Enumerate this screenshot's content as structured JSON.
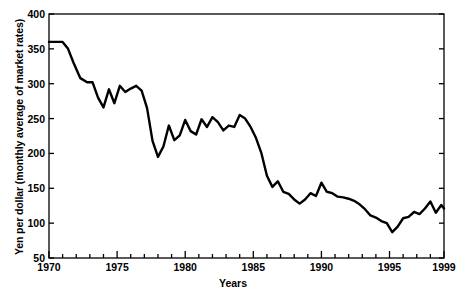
{
  "chart_data": {
    "type": "line",
    "title": "",
    "xlabel": "Years",
    "ylabel": "Yen per dollar (monthly average of market rates)",
    "xlim": [
      1970,
      1999
    ],
    "ylim": [
      50,
      400
    ],
    "grid": false,
    "legend": null,
    "y_ticks": [
      50,
      100,
      150,
      200,
      250,
      300,
      350,
      400
    ],
    "y_tick_labels": [
      "50",
      "100",
      "150",
      "200",
      "250",
      "300",
      "350",
      "400"
    ],
    "x_ticks": [
      1970,
      1975,
      1980,
      1985,
      1990,
      1995,
      1999
    ],
    "x_tick_labels": [
      "1970",
      "1975",
      "1980",
      "1985",
      "1990",
      "1995",
      "1999"
    ],
    "x_minor_tick_interval": 1,
    "line_color": "#000000",
    "line_width": 2.4,
    "series": [
      {
        "name": "Yen per dollar",
        "x": [
          1970.0,
          1970.5,
          1971.0,
          1971.4,
          1971.8,
          1972.3,
          1972.8,
          1973.2,
          1973.6,
          1974.0,
          1974.4,
          1974.8,
          1975.2,
          1975.6,
          1976.0,
          1976.4,
          1976.8,
          1977.2,
          1977.6,
          1978.0,
          1978.4,
          1978.8,
          1979.2,
          1979.6,
          1980.0,
          1980.4,
          1980.8,
          1981.2,
          1981.6,
          1982.0,
          1982.4,
          1982.8,
          1983.2,
          1983.6,
          1984.0,
          1984.4,
          1984.8,
          1985.2,
          1985.6,
          1986.0,
          1986.4,
          1986.8,
          1987.2,
          1987.6,
          1988.0,
          1988.4,
          1988.8,
          1989.2,
          1989.6,
          1990.0,
          1990.4,
          1990.8,
          1991.2,
          1991.6,
          1992.0,
          1992.4,
          1992.8,
          1993.2,
          1993.6,
          1994.0,
          1994.4,
          1994.8,
          1995.2,
          1995.6,
          1996.0,
          1996.4,
          1996.8,
          1997.2,
          1997.6,
          1998.0,
          1998.4,
          1998.8,
          1999.0
        ],
        "values": [
          360,
          360,
          360,
          350,
          330,
          308,
          302,
          302,
          280,
          266,
          292,
          272,
          297,
          288,
          293,
          297,
          290,
          265,
          218,
          195,
          210,
          240,
          219,
          226,
          248,
          232,
          227,
          249,
          238,
          252,
          245,
          233,
          240,
          238,
          255,
          250,
          238,
          222,
          200,
          168,
          152,
          160,
          145,
          142,
          134,
          128,
          134,
          143,
          139,
          158,
          145,
          143,
          138,
          137,
          135,
          132,
          127,
          120,
          111,
          108,
          103,
          100,
          87,
          95,
          107,
          109,
          116,
          113,
          121,
          131,
          115,
          126,
          121
        ]
      }
    ]
  },
  "axis": {
    "x_title": "Years",
    "y_title": "Yen per dollar (monthly average of market rates)"
  }
}
